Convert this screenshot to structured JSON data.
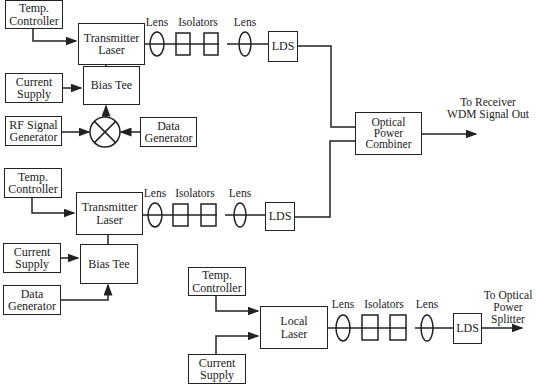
{
  "diagram": {
    "transmitter_1": {
      "temp_controller": "Temp.\nController",
      "laser": "Transmitter\nLaser",
      "current_supply": "Current\nSupply",
      "bias_tee": "Bias Tee",
      "rf_generator": "RF Signal\nGenerator",
      "data_generator": "Data\nGenerator",
      "lens_1": "Lens",
      "isolators": "Isolators",
      "lens_2": "Lens",
      "lds": "LDS"
    },
    "transmitter_2": {
      "temp_controller": "Temp.\nController",
      "laser": "Transmitter\nLaser",
      "current_supply": "Current\nSupply",
      "bias_tee": "Bias Tee",
      "data_generator": "Data\nGenerator",
      "lens_1": "Lens",
      "isolators": "Isolators",
      "lens_2": "Lens",
      "lds": "LDS"
    },
    "combiner": {
      "label": "Optical\nPower\nCombiner",
      "output_label": "To Receiver\nWDM Signal Out"
    },
    "local": {
      "temp_controller": "Temp.\nController",
      "laser": "Local\nLaser",
      "current_supply": "Current\nSupply",
      "lens_1": "Lens",
      "isolators": "Isolators",
      "lens_2": "Lens",
      "lds": "LDS",
      "output_label": "To Optical\nPower Splitter"
    }
  }
}
